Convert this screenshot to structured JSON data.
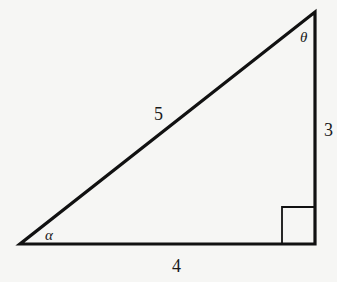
{
  "diagram": {
    "type": "right-triangle",
    "stroke_color": "#111111",
    "background": "#f6f6f4",
    "vertices": {
      "left": [
        20,
        244
      ],
      "right_angle": [
        315,
        244
      ],
      "top": [
        315,
        12
      ]
    },
    "sides": {
      "hypotenuse": "5",
      "vertical_leg": "3",
      "horizontal_leg": "4"
    },
    "angles": {
      "bottom_left": "α",
      "top": "θ"
    },
    "right_angle_marker": {
      "x": 281,
      "y": 207,
      "size": 34
    }
  }
}
